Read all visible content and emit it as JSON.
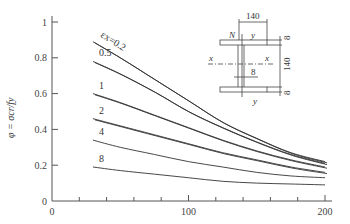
{
  "chart_data": {
    "type": "line",
    "title": "",
    "xlabel": "",
    "ylabel": "φ = σcr/fy",
    "xlim": [
      0,
      200
    ],
    "ylim": [
      0,
      1
    ],
    "xticks": [
      "0",
      "100",
      "200"
    ],
    "yticks": [
      "0",
      "0.2",
      "0.4",
      "0.6",
      "0.8",
      "1"
    ],
    "grid": false,
    "legend_position": "inline labels",
    "x": [
      30,
      50,
      75,
      100,
      125,
      150,
      175,
      200
    ],
    "series": [
      {
        "name": "εx=0.2",
        "label": "εx=0.2",
        "values": [
          0.89,
          0.8,
          0.68,
          0.56,
          0.44,
          0.35,
          0.27,
          0.22
        ]
      },
      {
        "name": "0.5",
        "label": "0.5",
        "values": [
          0.78,
          0.71,
          0.61,
          0.5,
          0.41,
          0.33,
          0.26,
          0.21
        ]
      },
      {
        "name": "1",
        "label": "1",
        "values": [
          0.6,
          0.55,
          0.48,
          0.41,
          0.34,
          0.28,
          0.23,
          0.19
        ]
      },
      {
        "name": "2",
        "label": "2",
        "values": [
          0.46,
          0.42,
          0.37,
          0.32,
          0.27,
          0.23,
          0.19,
          0.16
        ]
      },
      {
        "name": "4",
        "label": "4",
        "values": [
          0.34,
          0.3,
          0.26,
          0.22,
          0.19,
          0.16,
          0.14,
          0.13
        ]
      },
      {
        "name": "8",
        "label": "8",
        "values": [
          0.19,
          0.17,
          0.15,
          0.13,
          0.11,
          0.1,
          0.095,
          0.09
        ]
      }
    ],
    "inset_diagram": {
      "description": "I-section cross-section",
      "flange_width": "140",
      "web_height": "140",
      "flange_thickness": "8",
      "web_thickness": "8",
      "labels": [
        "N",
        "y",
        "x",
        "x",
        "y"
      ]
    }
  }
}
